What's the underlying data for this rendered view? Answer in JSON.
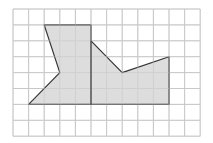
{
  "grid": {
    "cols": 12,
    "rows": 8,
    "origin_x": 13,
    "origin_y": 9,
    "cell_w": 15.6,
    "cell_h": 15.9,
    "line_color": "#c8c8c8"
  },
  "shape": {
    "description": "Shaded irregular polygon on square grid",
    "vertices": [
      [
        2,
        1
      ],
      [
        5,
        1
      ],
      [
        5,
        2
      ],
      [
        7,
        4
      ],
      [
        10,
        3
      ],
      [
        10,
        6
      ],
      [
        1,
        6
      ],
      [
        3,
        4
      ]
    ],
    "fill": "#d9d9d9",
    "stroke": "#333333",
    "divider": [
      [
        5,
        2
      ],
      [
        5,
        6
      ]
    ]
  }
}
